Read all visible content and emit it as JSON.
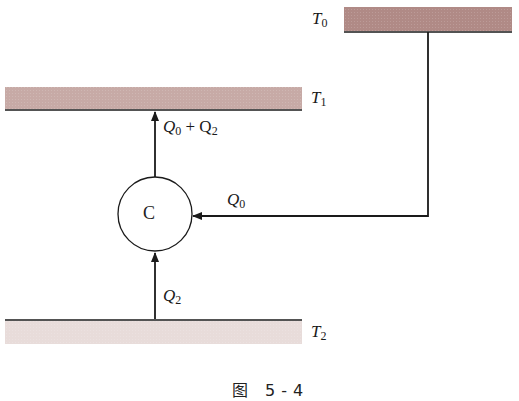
{
  "figure": {
    "caption": "图 5-4",
    "reservoirs": [
      {
        "id": "T0",
        "symbol": "T",
        "sub": "0",
        "color": "#b08a86"
      },
      {
        "id": "T1",
        "symbol": "T",
        "sub": "1",
        "color": "#c7aaa6"
      },
      {
        "id": "T2",
        "symbol": "T",
        "sub": "2",
        "color": "#e8dcda"
      }
    ],
    "engine": {
      "label": "C"
    },
    "flows": [
      {
        "id": "Q0_plus_Q2",
        "parts": [
          "Q",
          "0",
          " + Q",
          "2"
        ]
      },
      {
        "id": "Q0",
        "symbol": "Q",
        "sub": "0"
      },
      {
        "id": "Q2",
        "symbol": "Q",
        "sub": "2"
      }
    ],
    "line_color": "#1a1a1a"
  }
}
